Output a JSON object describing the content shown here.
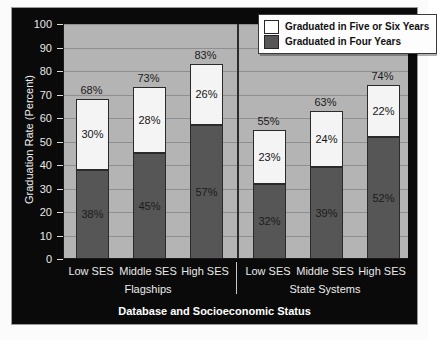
{
  "chart_data": {
    "type": "bar",
    "subtype": "stacked-bar",
    "title": "",
    "xlabel": "Database and Socioeconomic Status",
    "ylabel": "Graduation Rate (Percent)",
    "ylim": [
      0,
      100
    ],
    "ytick_labels": [
      "100",
      "90",
      "80",
      "70",
      "60",
      "50",
      "40",
      "30",
      "20",
      "10",
      "0"
    ],
    "ytick_values": [
      100,
      90,
      80,
      70,
      60,
      50,
      40,
      30,
      20,
      10,
      0
    ],
    "grid": true,
    "legend_position": "top-right",
    "categories": [
      "Low SES",
      "Middle SES",
      "High SES",
      "Low SES",
      "Middle SES",
      "High SES"
    ],
    "groups": [
      {
        "name": "Flagships",
        "categories": [
          "Low SES",
          "Middle SES",
          "High SES"
        ]
      },
      {
        "name": "State Systems",
        "categories": [
          "Low SES",
          "Middle SES",
          "High SES"
        ]
      }
    ],
    "series": [
      {
        "name": "Graduated in Four Years",
        "color": "#565656",
        "values": [
          38,
          45,
          57,
          32,
          39,
          52
        ]
      },
      {
        "name": "Graduated in Five or Six Years",
        "color": "#f4f4f4",
        "values": [
          30,
          28,
          26,
          23,
          24,
          22
        ]
      }
    ],
    "totals": [
      68,
      73,
      83,
      55,
      63,
      74
    ],
    "bars": [
      {
        "group": "Flagships",
        "category": "Low SES",
        "four_years": 38,
        "four_years_label": "38%",
        "five_or_six_years": 30,
        "five_or_six_years_label": "30%",
        "total": 68,
        "total_label": "68%"
      },
      {
        "group": "Flagships",
        "category": "Middle SES",
        "four_years": 45,
        "four_years_label": "45%",
        "five_or_six_years": 28,
        "five_or_six_years_label": "28%",
        "total": 73,
        "total_label": "73%"
      },
      {
        "group": "Flagships",
        "category": "High SES",
        "four_years": 57,
        "four_years_label": "57%",
        "five_or_six_years": 26,
        "five_or_six_years_label": "26%",
        "total": 83,
        "total_label": "83%"
      },
      {
        "group": "State Systems",
        "category": "Low SES",
        "four_years": 32,
        "four_years_label": "32%",
        "five_or_six_years": 23,
        "five_or_six_years_label": "23%",
        "total": 55,
        "total_label": "55%"
      },
      {
        "group": "State Systems",
        "category": "Middle SES",
        "four_years": 39,
        "four_years_label": "39%",
        "five_or_six_years": 24,
        "five_or_six_years_label": "24%",
        "total": 63,
        "total_label": "63%"
      },
      {
        "group": "State Systems",
        "category": "High SES",
        "four_years": 52,
        "four_years_label": "52%",
        "five_or_six_years": 22,
        "five_or_six_years_label": "22%",
        "total": 74,
        "total_label": "74%"
      }
    ]
  },
  "legend": {
    "items": [
      {
        "label": "Graduated in Five or Six Years",
        "color": "#ffffff"
      },
      {
        "label": "Graduated in Four Years",
        "color": "#565656"
      }
    ]
  },
  "colors": {
    "panel_background": "#0a0a0a",
    "plot_background": "#b4b4b4",
    "four_years": "#565656",
    "five_or_six_years": "#f4f4f4",
    "gridline": "#8f8f8f",
    "axis_text": "#e9e9e9"
  }
}
